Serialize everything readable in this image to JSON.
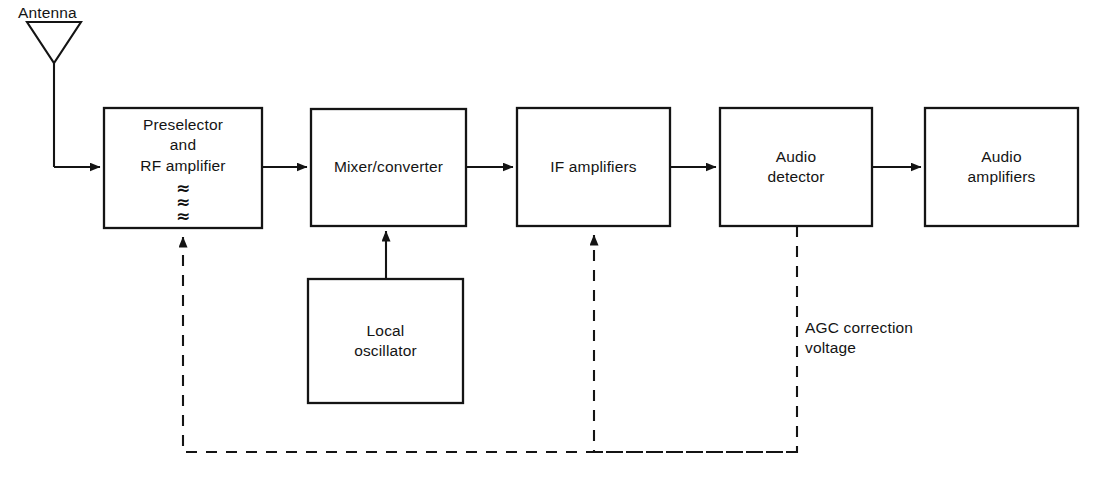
{
  "diagram": {
    "stroke_color": "#141414",
    "background_color": "#ffffff",
    "signal_line_style": "solid",
    "feedback_line_style": "dashed"
  },
  "antenna": {
    "label": "Antenna",
    "symbol": "inverted-triangle-dipole"
  },
  "blocks": [
    {
      "id": "preselector-rf-amplifier",
      "label": "Preselector\nand\nRF amplifier",
      "tuning_symbols": "≈\n≈\n≈",
      "x": 104,
      "y": 108,
      "w": 158,
      "h": 120
    },
    {
      "id": "mixer-converter",
      "label": "Mixer/converter",
      "x": 311,
      "y": 109,
      "w": 155,
      "h": 117
    },
    {
      "id": "if-amplifiers",
      "label": "IF amplifiers",
      "x": 517,
      "y": 108,
      "w": 153,
      "h": 118
    },
    {
      "id": "audio-detector",
      "label": "Audio\ndetector",
      "x": 720,
      "y": 108,
      "w": 152,
      "h": 118
    },
    {
      "id": "audio-amplifiers",
      "label": "Audio\namplifiers",
      "x": 925,
      "y": 108,
      "w": 153,
      "h": 118
    },
    {
      "id": "local-oscillator",
      "label": "Local\noscillator",
      "x": 308,
      "y": 279,
      "w": 155,
      "h": 124
    }
  ],
  "annotations": [
    {
      "id": "agc-correction-voltage",
      "label": "AGC correction\nvoltage",
      "x": 805,
      "y": 318
    }
  ],
  "connections": [
    {
      "id": "antenna-to-preselector",
      "from": "antenna",
      "to": "preselector-rf-amplifier",
      "style": "solid",
      "arrow": true
    },
    {
      "id": "preselector-to-mixer",
      "from": "preselector-rf-amplifier",
      "to": "mixer-converter",
      "style": "solid",
      "arrow": true
    },
    {
      "id": "mixer-to-if",
      "from": "mixer-converter",
      "to": "if-amplifiers",
      "style": "solid",
      "arrow": true
    },
    {
      "id": "if-to-detector",
      "from": "if-amplifiers",
      "to": "audio-detector",
      "style": "solid",
      "arrow": true
    },
    {
      "id": "detector-to-audio-amplifiers",
      "from": "audio-detector",
      "to": "audio-amplifiers",
      "style": "solid",
      "arrow": true
    },
    {
      "id": "local-oscillator-to-mixer",
      "from": "local-oscillator",
      "to": "mixer-converter",
      "style": "solid",
      "arrow": true
    },
    {
      "id": "agc-to-if-amplifiers",
      "from": "audio-detector",
      "to": "if-amplifiers",
      "style": "dashed",
      "arrow": true
    },
    {
      "id": "agc-to-preselector",
      "from": "audio-detector",
      "to": "preselector-rf-amplifier",
      "style": "dashed",
      "arrow": true
    }
  ]
}
